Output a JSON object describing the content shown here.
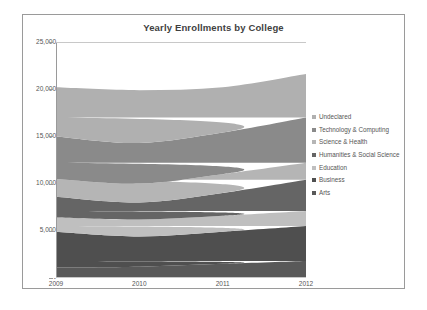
{
  "chart_data": {
    "type": "area",
    "stacked": true,
    "title": "Yearly Enrollments by College",
    "xlabel": "",
    "ylabel": "",
    "categories": [
      "2009",
      "2010",
      "2011",
      "2012"
    ],
    "x_tick_labels": [
      "2009",
      "2010",
      "2011",
      "2012"
    ],
    "y_tick_labels": [
      "25,000",
      "20,000",
      "15,000",
      "10,000",
      "5,000",
      "-"
    ],
    "y_tick_values": [
      25000,
      20000,
      15000,
      10000,
      5000,
      0
    ],
    "ylim": [
      0,
      25000
    ],
    "grid": false,
    "legend_position": "right",
    "series": [
      {
        "name": "Arts",
        "color": "#595959",
        "values": [
          1100,
          1200,
          1500,
          1800
        ]
      },
      {
        "name": "Business",
        "color": "#4f4f4f",
        "values": [
          3800,
          3200,
          3400,
          3700
        ]
      },
      {
        "name": "Education",
        "color": "#bfbfbf",
        "values": [
          1500,
          1800,
          1700,
          1600
        ]
      },
      {
        "name": "Humanities & Social Science",
        "color": "#656565",
        "values": [
          2200,
          1800,
          2400,
          3300
        ]
      },
      {
        "name": "Science & Health",
        "color": "#b5b5b5",
        "values": [
          1900,
          2000,
          2000,
          1800
        ]
      },
      {
        "name": "Technology & Computing",
        "color": "#8a8a8a",
        "values": [
          4500,
          4300,
          4400,
          4800
        ]
      },
      {
        "name": "Undeclared",
        "color": "#b0b0b0",
        "values": [
          5200,
          5600,
          4800,
          4600
        ]
      }
    ],
    "cumulative_totals": {
      "2009": [
        1100,
        4900,
        6400,
        8600,
        10500,
        15000,
        20200
      ],
      "2010": [
        1200,
        4400,
        6200,
        8000,
        10000,
        14300,
        19900
      ],
      "2011": [
        1500,
        4900,
        6600,
        9000,
        11000,
        15400,
        20200
      ],
      "2012": [
        1800,
        5500,
        7100,
        10400,
        12200,
        17000,
        21600
      ]
    }
  },
  "legend": {
    "items": [
      {
        "label": "Undeclared",
        "color": "#b0b0b0"
      },
      {
        "label": "Technology & Computing",
        "color": "#8a8a8a"
      },
      {
        "label": "Science & Health",
        "color": "#b5b5b5"
      },
      {
        "label": "Humanities & Social Science",
        "color": "#656565"
      },
      {
        "label": "Education",
        "color": "#bfbfbf"
      },
      {
        "label": "Business",
        "color": "#4f4f4f"
      },
      {
        "label": "Arts",
        "color": "#595959"
      }
    ]
  },
  "style": {
    "frame_border_color": "#9a9a9a",
    "axis_color": "#9a9a9a",
    "text_color": "#555555",
    "title_color": "#3f3f3f",
    "plot_background": "#ffffff"
  }
}
